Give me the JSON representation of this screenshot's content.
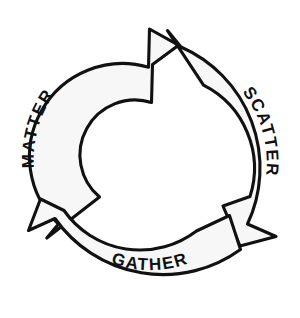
{
  "diagram": {
    "type": "cycle",
    "shape": "three-segment circular arrow loop",
    "direction": "clockwise",
    "background_color": "#ffffff",
    "band_fill_color": "#f7f7f7",
    "stroke_color": "#111111",
    "center": {
      "x": 150,
      "y": 160
    },
    "outer_radius": 132,
    "inner_radius": 93,
    "segments": [
      {
        "id": "matter",
        "label": "MATTER",
        "position": "left",
        "text_orientation": "bottom-to-top",
        "arrow_tip": {
          "x": 178,
          "y": 45
        }
      },
      {
        "id": "scatter",
        "label": "SCATTER",
        "position": "right",
        "text_orientation": "top-to-bottom",
        "arrow_tip": {
          "x": 241,
          "y": 246
        }
      },
      {
        "id": "gather",
        "label": "GATHER",
        "position": "bottom",
        "text_orientation": "horizontal",
        "arrow_tip": {
          "x": 40,
          "y": 239
        }
      }
    ]
  }
}
